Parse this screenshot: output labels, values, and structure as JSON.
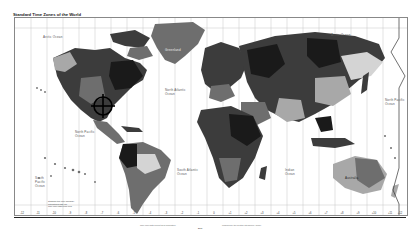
{
  "map": {
    "title": "Standard Time Zones of the World",
    "ocean_labels": {
      "arctic_left": "Arctic Ocean",
      "arctic_right": "Arctic Ocean",
      "north_atlantic": "North Atlantic Ocean",
      "north_pacific_left": "North Pacific Ocean",
      "north_pacific_right": "North Pacific Ocean",
      "south_pacific": "South Pacific Ocean",
      "south_atlantic": "South Atlantic Ocean",
      "indian": "Indian Ocean"
    },
    "continent_labels": {
      "greenland": "Greenland",
      "australia": "Australia"
    },
    "legend": {
      "line1": "Standard time zone boundary",
      "line2": "International date line",
      "line3": "Time zone offset from UTC"
    },
    "hour_labels": [
      "-12",
      "-11",
      "-10",
      "-9",
      "-8",
      "-7",
      "-6",
      "-5",
      "-4",
      "-3",
      "-2",
      "-1",
      "0",
      "+1",
      "+2",
      "+3",
      "+4",
      "+5",
      "+6",
      "+7",
      "+8",
      "+9",
      "+10",
      "+11",
      "+12"
    ],
    "footer": {
      "note_left": "Time zone data current as of publication",
      "note_right": "Produced by the Central Intelligence Agency",
      "map_id": "8031"
    },
    "colors": {
      "land_darkest": "#1a1a1a",
      "land_dark": "#3c3c3c",
      "land_mid": "#6e6e6e",
      "land_light": "#a8a8a8",
      "land_lightest": "#d4d4d4",
      "ocean": "#ffffff",
      "grid": "#bbbbbb",
      "marker_color": "#000000"
    }
  }
}
